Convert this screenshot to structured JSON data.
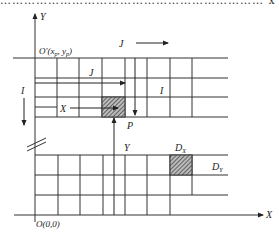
{
  "figure": {
    "clipped_header_text": "…………………………………………………………  x_p  …",
    "axes": {
      "y_label": "Y",
      "x_label": "X",
      "origin_label": "O(0,0)",
      "local_origin_label": "O′(x",
      "local_origin_sub1": "p",
      "local_origin_mid": ", y",
      "local_origin_sub2": "p",
      "local_origin_end": ")"
    },
    "labels": {
      "J_top": "J",
      "J_inner": "J",
      "I_left": "I",
      "I_inner": "I",
      "X_arrow": "X",
      "P": "P",
      "Y_arrow": "Y",
      "DX": "D",
      "DX_sub": "X",
      "DY": "D",
      "DY_sub": "Y"
    },
    "colors": {
      "line": "#333333",
      "hatch": "#444444",
      "background": "#ffffff"
    }
  }
}
